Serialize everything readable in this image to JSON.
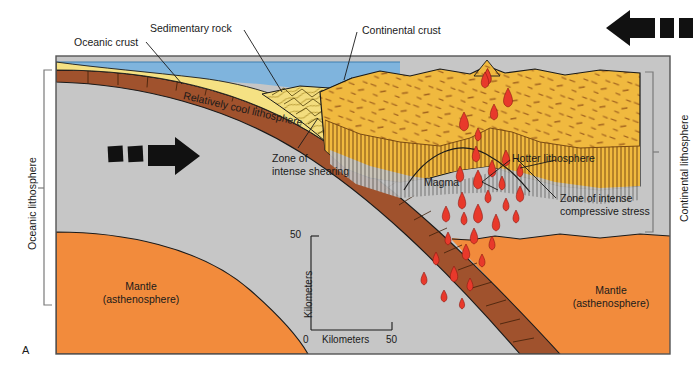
{
  "figure": {
    "panel_label": "A",
    "type": "geologic-cross-section"
  },
  "brackets": {
    "left": {
      "label": "Oceanic lithosphere"
    },
    "right": {
      "label": "Continental lithosphere"
    }
  },
  "callouts": {
    "oceanic_crust": "Oceanic crust",
    "sedimentary_rock": "Sedimentary rock",
    "continental_crust": "Continental crust",
    "relatively_cool_lithosphere": "Relatively cool lithosphere",
    "zone_of_intense_shearing_l1": "Zone of",
    "zone_of_intense_shearing_l2": "intense shearing",
    "hotter_lithosphere": "Hotter lithosphere",
    "magma": "Magma",
    "zone_compressive_l1": "Zone of intense",
    "zone_compressive_l2": "compressive stress",
    "mantle_left_l1": "Mantle",
    "mantle_left_l2": "(asthenosphere)",
    "mantle_right_l1": "Mantle",
    "mantle_right_l2": "(asthenosphere)"
  },
  "scale": {
    "vertical_axis_label": "Kilometers",
    "vertical_max": "50",
    "horizontal_axis_label": "Kilometers",
    "horizontal_min": "0",
    "horizontal_max": "50"
  },
  "motion_arrows": {
    "oceanic_plate": {
      "name": "oceanic-plate-motion-arrow",
      "direction": "right"
    },
    "continental_plate": {
      "name": "continental-plate-motion-arrow",
      "direction": "left"
    }
  },
  "colors": {
    "ocean_water": "#7fb4dd",
    "sediment": "#f5e183",
    "accretionary_wedge": "#f3dd7e",
    "oceanic_crust": "#a0522d",
    "continental_crust": "#f0b93f",
    "lithosphere_mantle": "#c6c6c6",
    "asthenosphere": "#f28b3c",
    "magma": "#e8392b",
    "outline": "#1a1a1a",
    "frame": "#555555",
    "ash_cloud": "#f2f2f2"
  }
}
